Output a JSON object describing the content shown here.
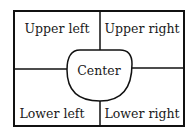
{
  "diagram": {
    "regions": {
      "upper_left": "Upper left",
      "upper_right": "Upper right",
      "center": "Center",
      "lower_left": "Lower left",
      "lower_right": "Lower right"
    },
    "colors": {
      "line": "#111111",
      "text": "#1a1a1a",
      "background": "#ffffff"
    }
  }
}
